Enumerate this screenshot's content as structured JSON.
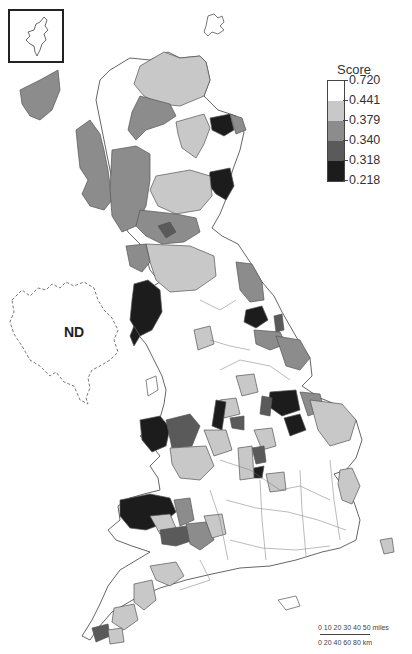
{
  "map": {
    "title": "",
    "corner_text": "",
    "no_data_label": "ND",
    "region": "Great Britain",
    "inset": "Shetland Islands",
    "legend": {
      "title": "Score",
      "breaks": [
        "0.720",
        "0.441",
        "0.379",
        "0.340",
        "0.318",
        "0.218"
      ],
      "classes": [
        {
          "range": "0.441–0.720",
          "color": "#ffffff"
        },
        {
          "range": "0.379–0.441",
          "color": "#c8c8c8"
        },
        {
          "range": "0.340–0.379",
          "color": "#8c8c8c"
        },
        {
          "range": "0.318–0.340",
          "color": "#5a5a5a"
        },
        {
          "range": "0.218–0.318",
          "color": "#1c1c1c"
        }
      ]
    },
    "scale_bar": {
      "miles_label": "0  10  20  30  40  50 miles",
      "km_label": "0    20    40    60    80 km"
    },
    "colors": {
      "outline": "#555555",
      "class_1": "#ffffff",
      "class_2": "#c8c8c8",
      "class_3": "#8c8c8c",
      "class_4": "#5a5a5a",
      "class_5": "#1c1c1c"
    }
  }
}
